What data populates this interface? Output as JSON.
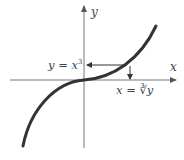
{
  "diagram": {
    "axes": {
      "x_label": "x",
      "y_label": "y"
    },
    "curve": {
      "equation_label": "y = x",
      "equation_exponent": "3",
      "inverse_label_prefix": "x = ",
      "inverse_label_root": "∛",
      "inverse_label_var": "y"
    },
    "colors": {
      "curve": "#333333",
      "axis": "#777777",
      "arrow": "#333333",
      "text": "#444444"
    }
  }
}
